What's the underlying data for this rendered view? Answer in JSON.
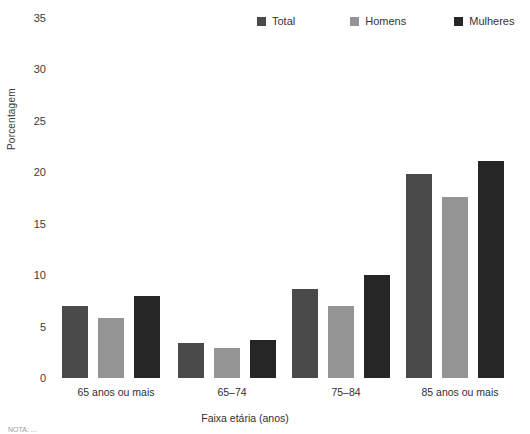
{
  "chart_data": {
    "type": "bar",
    "title": "",
    "xlabel": "Faixa etária (anos)",
    "ylabel": "Porcentagem",
    "categories": [
      "65 anos ou mais",
      "65–74",
      "75–84",
      "85 anos ou mais"
    ],
    "series": [
      {
        "name": "Total",
        "color": "#4a4a4a",
        "values": [
          7.0,
          3.4,
          8.7,
          19.8
        ]
      },
      {
        "name": "Homens",
        "color": "#949494",
        "values": [
          5.8,
          2.9,
          7.0,
          17.6
        ]
      },
      {
        "name": "Mulheres",
        "color": "#262626",
        "values": [
          8.0,
          3.7,
          10.0,
          21.1
        ]
      }
    ],
    "ylim": [
      0,
      35
    ],
    "yticks": [
      "0",
      "5",
      "10",
      "15",
      "20",
      "25",
      "30",
      "35"
    ],
    "ytick_values": [
      0,
      5,
      10,
      15,
      20,
      25,
      30,
      35
    ],
    "grid": false,
    "legend_position": "top-right"
  },
  "legend": {
    "items": [
      {
        "label": "Total",
        "color": "#4a4a4a"
      },
      {
        "label": "Homens",
        "color": "#949494"
      },
      {
        "label": "Mulheres",
        "color": "#262626"
      }
    ]
  },
  "axes": {
    "y_title": "Porcentagem",
    "x_title": "Faixa etária (anos)"
  },
  "footnote": {
    "text": "NOTA: ..."
  }
}
